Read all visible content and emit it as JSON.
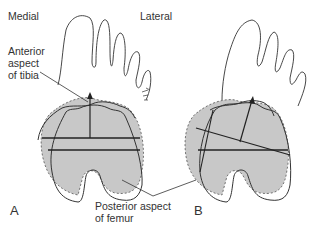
{
  "labels": {
    "medial": "Medial",
    "lateral": "Lateral",
    "anterior_tibia_line1": "Anterior",
    "anterior_tibia_line2": "aspect",
    "anterior_tibia_line3": "of tibia",
    "posterior_femur_line1": "Posterior aspect",
    "posterior_femur_line2": "of femur"
  },
  "panels": [
    {
      "letter": "A",
      "description": "Foot and tibial/femoral outlines aligned; tibial axis perpendicular to horizontal lines"
    },
    {
      "letter": "B",
      "description": "Rotated alignment; tibial axis oblique with crossing lines"
    }
  ],
  "colors": {
    "line": "#333333",
    "fill": "#c8c8c8",
    "text": "#333333"
  }
}
